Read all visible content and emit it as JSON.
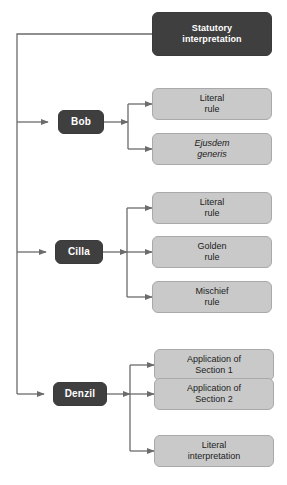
{
  "diagram": {
    "type": "tree-flowchart",
    "colors": {
      "dark_node_fill": "#3f3f3f",
      "dark_node_text": "#ffffff",
      "light_node_fill": "#c9c9c9",
      "light_node_text": "#1c1c1c",
      "light_node_border": "#a9a9a9",
      "connector": "#6b6b6b",
      "background": "#ffffff"
    },
    "root": {
      "label": "Statutory\ninterpretation"
    },
    "branches": [
      {
        "name": "bob",
        "label": "Bob",
        "children": [
          {
            "name": "bob-literal-rule",
            "label": "Literal\nrule",
            "italic": false
          },
          {
            "name": "bob-ejusdem-generis",
            "label": "Ejusdem\ngeneris",
            "italic": true
          }
        ]
      },
      {
        "name": "cilla",
        "label": "Cilla",
        "children": [
          {
            "name": "cilla-literal-rule",
            "label": "Literal\nrule",
            "italic": false
          },
          {
            "name": "cilla-golden-rule",
            "label": "Golden\nrule",
            "italic": false
          },
          {
            "name": "cilla-mischief-rule",
            "label": "Mischief\nrule",
            "italic": false
          }
        ]
      },
      {
        "name": "denzil",
        "label": "Denzil",
        "children": [
          {
            "name": "denzil-application-section-1",
            "label": "Application of\nSection 1",
            "italic": false
          },
          {
            "name": "denzil-application-section-2",
            "label": "Application of\nSection 2",
            "italic": false
          },
          {
            "name": "denzil-literal-interpretation",
            "label": "Literal\ninterpretation",
            "italic": false
          }
        ]
      }
    ]
  }
}
